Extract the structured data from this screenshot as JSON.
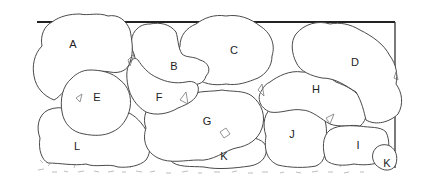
{
  "diagram": {
    "type": "planting-plan",
    "labels": {
      "A": "A",
      "B": "B",
      "C": "C",
      "D": "D",
      "E": "E",
      "F": "F",
      "G": "G",
      "H": "H",
      "I": "I",
      "J": "J",
      "K1": "K",
      "K2": "K",
      "L": "L"
    },
    "colors": {
      "outline": "#4a4a4a",
      "wall": "#222222",
      "fill": "#ffffff",
      "ground": "#b5b5b5"
    }
  }
}
